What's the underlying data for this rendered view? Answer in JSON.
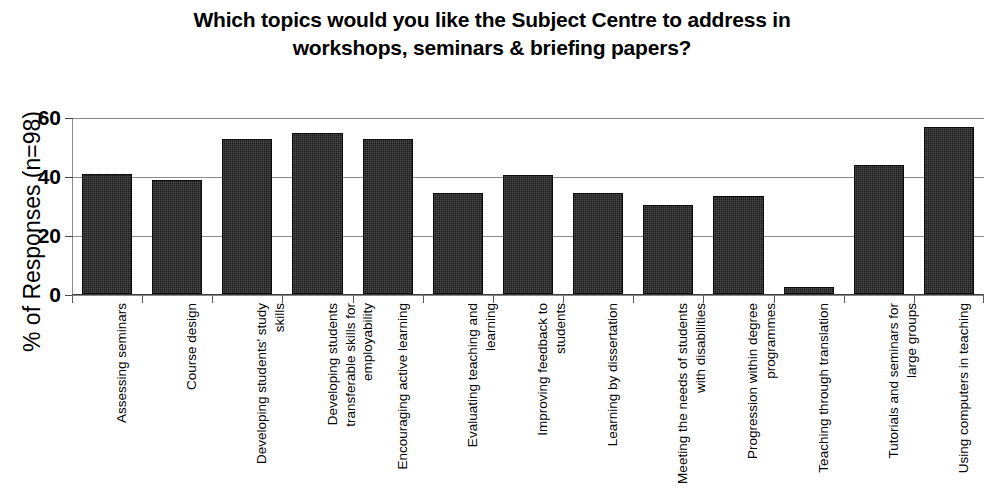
{
  "chart_data": {
    "type": "bar",
    "title": "Which topics would you like the Subject Centre to address in workshops, seminars & briefing papers?",
    "title_lines": [
      "Which topics would you like the Subject Centre to address in",
      "workshops, seminars & briefing papers?"
    ],
    "xlabel": "",
    "ylabel": "% of Responses (n=98)",
    "ylim": [
      0,
      60
    ],
    "yticks": [
      0,
      20,
      40,
      60
    ],
    "ytick_labels": [
      "0",
      "20",
      "40",
      "60"
    ],
    "grid": true,
    "legend": "none",
    "bar_color": "#1c1c1c",
    "categories": [
      "Assessing seminars",
      "Course design",
      "Developing students' study skills",
      "Developing students transferable skills for employability",
      "Encouraging active learning",
      "Evaluating teaching and learning",
      "Improving feedback to students",
      "Learning by dissertation",
      "Meeting the needs of students with disabilities",
      "Progression within degree programmes",
      "Teaching through translation",
      "Tutorials and seminars for large groups",
      "Using computers in teaching"
    ],
    "values": [
      41,
      39,
      53,
      55,
      53,
      34.5,
      40.5,
      34.5,
      30.5,
      33.5,
      2.5,
      44,
      57
    ]
  }
}
